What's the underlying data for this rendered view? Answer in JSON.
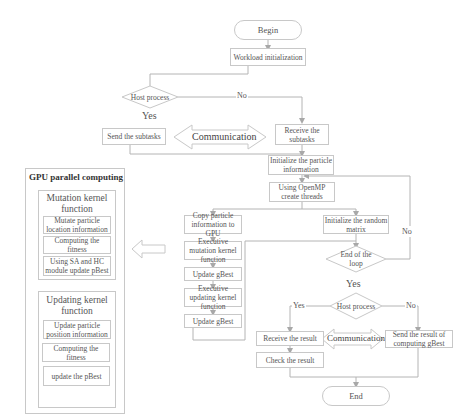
{
  "flowchart": {
    "begin": "Begin",
    "workload_init": "Workload initialization",
    "host_process_1": "Host process",
    "no_1": "No",
    "yes_1": "Yes",
    "send_subtasks": "Send the subtasks",
    "communication_1": "Communication",
    "receive_subtasks": "Receive the subtasks",
    "init_particle": "Initialize the particle information",
    "openmp": "Using OpenMP create threads",
    "copy_particle": "Copy particle information to GPU",
    "exec_mutation": "Executive mutation kernel function",
    "update_gbest_1": "Update gBest",
    "exec_updating": "Executive updating kernel function",
    "update_gbest_2": "Update gBest",
    "init_random": "Initialize the random matrix",
    "end_loop": "End of the loop",
    "no_loop": "No",
    "yes_loop": "Yes",
    "host_process_2": "Host process",
    "yes_2": "Yes",
    "no_2": "No",
    "receive_result": "Receive the result",
    "check_result": "Check the result",
    "communication_2": "Communication",
    "send_result": "Send the result of computing gBest",
    "end": "End"
  },
  "gpu_panel": {
    "title": "GPU parallel computing",
    "mutation_kernel": {
      "title": "Mutation kernel function",
      "steps": [
        "Mutate particle location information",
        "Computing the fitness",
        "Using SA and HC module update pBest"
      ]
    },
    "updating_kernel": {
      "title": "Updating kernel function",
      "steps": [
        "Update particle position information",
        "Computing the fitness",
        "update the pBest"
      ]
    }
  },
  "colors": {
    "line": "#b4b4b4",
    "border": "#c8c8c8",
    "text": "#555555"
  }
}
